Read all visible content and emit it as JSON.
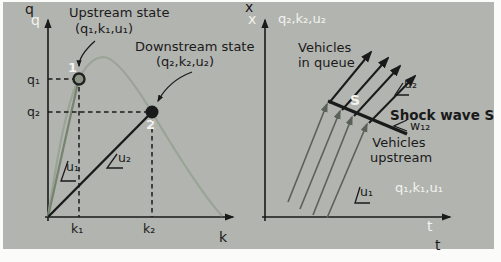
{
  "colors": {
    "background": "#b2b4b0",
    "frame": "#fbfbf9",
    "ink": "#1a1a1a",
    "white_text": "#f2f2ee",
    "curve": "#9aa496",
    "u1_line": "#76836f",
    "trajectory": "#5a6156",
    "point1_fill": "#8c9684"
  },
  "left_panel": {
    "y_axis_label": "q",
    "y_axis_label_ghost": "q",
    "x_axis_label": "k",
    "tick_q1": "q₁",
    "tick_q2": "q₂",
    "tick_k1": "k₁",
    "tick_k2": "k₂",
    "upstream_title": "Upstream state",
    "upstream_tuple": "(q₁,k₁,u₁)",
    "downstream_title": "Downstream state",
    "downstream_tuple": "(q₂,k₂,u₂)",
    "point1_number": "1",
    "point2_number": "2",
    "u1_label": "u₁",
    "u2_label": "u₂"
  },
  "right_panel": {
    "y_axis_label": "x",
    "y_axis_label_ghost": "x",
    "t_axis_label_ghost": "t",
    "t_axis_label": "t",
    "state2_region_label": "q₂,k₂,u₂",
    "vehicles_in_queue_line1": "Vehicles",
    "vehicles_in_queue_line2": "in queue",
    "u2_label": "u₂",
    "shock_point_label": "S",
    "shock_wave_label": "Shock wave S",
    "w12_label": "w₁₂",
    "vehicles_upstream_line1": "Vehicles",
    "vehicles_upstream_line2": "upstream",
    "state1_region_label": "q₁,k₁,u₁",
    "u1_label": "u₁"
  }
}
